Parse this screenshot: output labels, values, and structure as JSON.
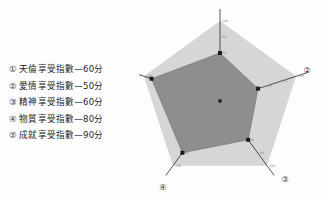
{
  "legend": {
    "items": [
      {
        "marker": "①",
        "label": "天倫享受指數—60分"
      },
      {
        "marker": "②",
        "label": "愛情享受指數—50分"
      },
      {
        "marker": "③",
        "label": "精神享受指數—60分"
      },
      {
        "marker": "④",
        "label": "物質享受指數—80分"
      },
      {
        "marker": "⑤",
        "label": "成就享受指數—90分"
      }
    ]
  },
  "corner_labels": {
    "axis1": "①",
    "axis2": "②",
    "axis3": "③",
    "axis4": "④",
    "axis5": "⑤"
  },
  "colors": {
    "outer_pentagon_fill": "#d6d6d6",
    "data_polygon_fill": "#8e8e8e",
    "axis_line": "#2b2b2b",
    "vertex_marker": "#1b1b1b",
    "tick_label": "#8d8d8d",
    "text": "#262626",
    "background": "#fdfdfd"
  },
  "chart_data": {
    "type": "radar",
    "title": "",
    "subtitle": "",
    "xlabel": "",
    "ylabel": "",
    "grid": false,
    "legend_position": "left",
    "axis_range": [
      0,
      100
    ],
    "tick_values": [
      20,
      40,
      60,
      80,
      100
    ],
    "categories": [
      "天倫享受指數",
      "愛情享受指數",
      "精神享受指數",
      "物質享受指數",
      "成就享受指數"
    ],
    "category_markers": [
      "①",
      "②",
      "③",
      "④",
      "⑤"
    ],
    "values": [
      60,
      50,
      60,
      80,
      90
    ],
    "units": "分",
    "series": [
      {
        "name": "享受指數",
        "values": [
          60,
          50,
          60,
          80,
          90
        ]
      }
    ]
  }
}
